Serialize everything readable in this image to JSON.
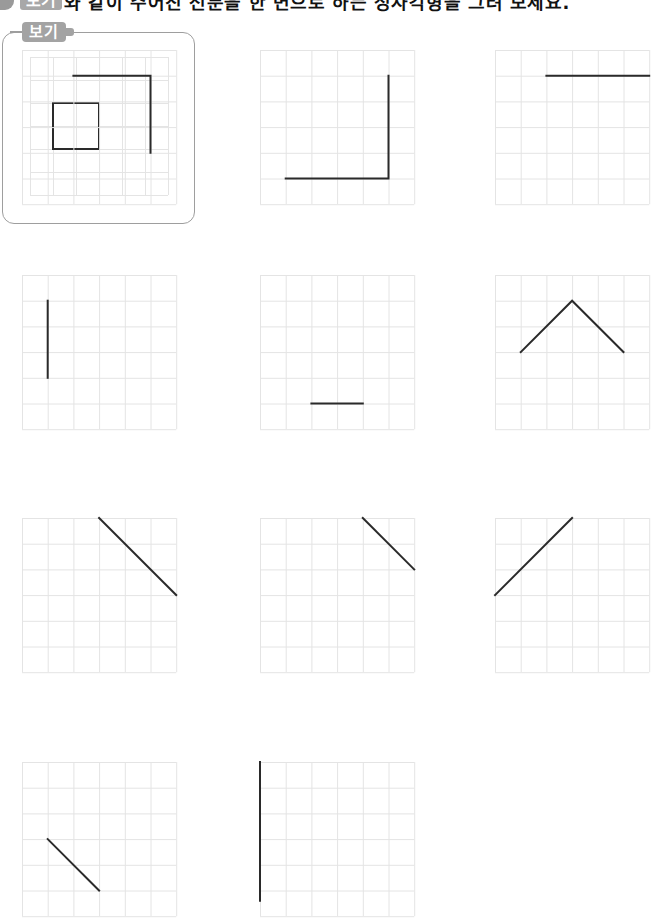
{
  "header": {
    "badge": "보기",
    "instruction": "와 같이 주어진 선분을 한 변으로 하는 정사각형을 그려 보세요."
  },
  "example": {
    "label": "보기",
    "grid": {
      "cols": 6,
      "rows": 6,
      "cell": 23
    },
    "shape": {
      "type": "square",
      "points": [
        [
          1,
          2
        ],
        [
          3,
          2
        ],
        [
          3,
          4
        ],
        [
          1,
          4
        ]
      ]
    }
  },
  "exercise": {
    "grid": {
      "cols": 6,
      "rows": 6,
      "cell": 25.7
    },
    "problems": [
      {
        "id": 1,
        "points": [
          [
            2,
            1
          ],
          [
            5,
            1
          ],
          [
            5,
            4
          ]
        ]
      },
      {
        "id": 2,
        "points": [
          [
            5,
            1
          ],
          [
            5,
            5
          ],
          [
            1,
            5
          ]
        ]
      },
      {
        "id": 3,
        "points": [
          [
            2,
            1
          ],
          [
            6,
            1
          ]
        ]
      },
      {
        "id": 4,
        "points": [
          [
            1,
            1
          ],
          [
            1,
            4
          ]
        ]
      },
      {
        "id": 5,
        "points": [
          [
            2,
            5
          ],
          [
            4,
            5
          ]
        ]
      },
      {
        "id": 6,
        "points": [
          [
            1,
            3
          ],
          [
            3,
            1
          ],
          [
            5,
            3
          ]
        ]
      },
      {
        "id": 7,
        "points": [
          [
            3,
            0
          ],
          [
            6,
            3
          ]
        ]
      },
      {
        "id": 8,
        "points": [
          [
            4,
            0
          ],
          [
            6,
            2
          ]
        ]
      },
      {
        "id": 9,
        "points": [
          [
            0,
            3
          ],
          [
            3,
            0
          ]
        ]
      },
      {
        "id": 10,
        "points": [
          [
            1,
            3
          ],
          [
            3,
            5
          ]
        ]
      },
      {
        "id": 11,
        "points": [
          [
            0,
            0
          ],
          [
            0,
            5.4
          ]
        ]
      }
    ]
  }
}
